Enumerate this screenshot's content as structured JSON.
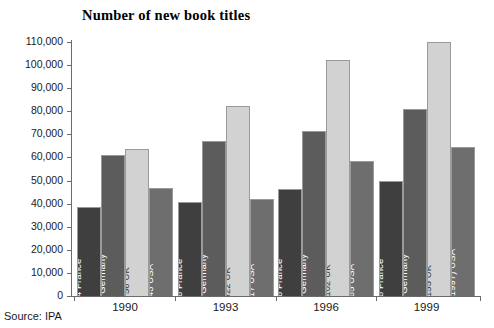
{
  "chart_data": {
    "type": "bar",
    "title": "Number of new book titles",
    "xlabel": "",
    "ylabel": "",
    "ylim": [
      0,
      110000
    ],
    "ytick_step": 10000,
    "grid": false,
    "legend": "none",
    "label_position": "inside-bar-rotated",
    "categories": [
      "1990",
      "1993",
      "1996",
      "1999"
    ],
    "ytick_labels": [
      "110,000",
      "100,000",
      "90,000",
      "80,000",
      "70,000",
      "60,000",
      "50,000",
      "40,000",
      "30,000",
      "20,000",
      "10,000",
      "0"
    ],
    "ytick_values": [
      110000,
      100000,
      90000,
      80000,
      70000,
      60000,
      50000,
      40000,
      30000,
      20000,
      10000,
      0
    ],
    "series": [
      {
        "name": "France",
        "color": "#3f3f3f",
        "values": [
          38414,
          40916,
          46306,
          49808
        ],
        "labels": [
          "38,414  France",
          "40,916  France",
          "46,306  France",
          "49,808  France"
        ]
      },
      {
        "name": "Germany",
        "color": "#5c5c5c",
        "values": [
          61015,
          67206,
          71515,
          80779
        ],
        "labels": [
          "61,015  Germany",
          "67,206  Germany",
          "71,515  Germany",
          "80,779  Germany"
        ]
      },
      {
        "name": "UK",
        "color": "#d2d2d2",
        "values": [
          63756,
          82322,
          102102,
          110155
        ],
        "labels": [
          "63,756  UK",
          "82,322  UK",
          "102,102  UK",
          "110,155  UK"
        ]
      },
      {
        "name": "USA",
        "color": "#6e6e6e",
        "values": [
          46743,
          42217,
          58465,
          64711
        ],
        "labels": [
          "46,743  USA",
          "42,217  USA",
          "58,465  USA",
          "64,711 (1997)  USA"
        ]
      }
    ],
    "annotations": [
      "64,711 (1997)"
    ],
    "source": "Source: IPA"
  },
  "axis": {
    "axis_color": "#6b6b6b"
  }
}
